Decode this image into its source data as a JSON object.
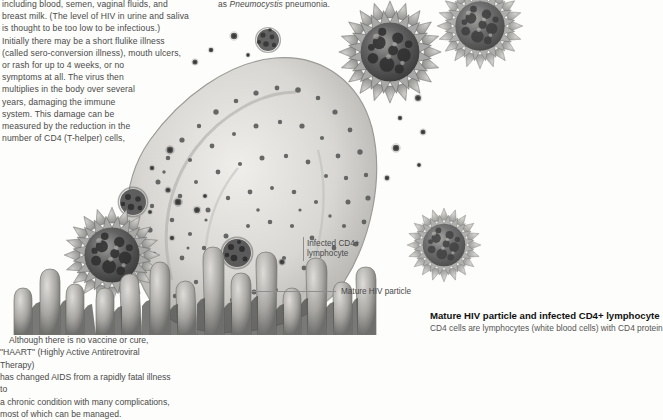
{
  "document": {
    "type": "textbook-page",
    "subject": "HIV and AIDS"
  },
  "left_column": {
    "text": "including blood, semen, vaginal fluids, and\nbreast milk. (The level of HIV in urine and saliva\nis thought to be too low to be infectious.)\nInitially there may be a short flulike illness\n(called sero-conversion illness), mouth ulcers,\nor rash for up to 4 weeks, or no\nsymptoms at all. The virus then\nmultiplies in the body over several\nyears, damaging the immune\nsystem. This damage can be\nmeasured by the reduction in the\nnumber of CD4 (T-helper) cells,"
  },
  "middle_note": {
    "prefix": "as ",
    "italic": "Pneumocystis",
    "suffix": " pneumonia."
  },
  "right_column": {
    "heading": "Kaposi's sarcoma skin lesion",
    "paragraph_1": "These tumors start as small, painless, flat areas\nor lumps, colored brown, red, blue, and purple,\nwhich look like bruises and grow until they",
    "paragraph_2": "candida, and cytomegalovirus, and a\ncancer called Kaposi's sarcoma.",
    "paragraph_3": "Those with HIV can be regularly monitored\nand have opportunistic infections treated\npromptly. People with HIV remain infectious\nthroughout their life, but can avoid passing it on\nby practicing safe sex using condoms. Pregnant\nmothers, who can pass HIV to their babies before\nor during birth, and by breastfeeding, can be\noffered antiretroviral drugs and cesarean delivery.\nThe only way to positively diagnose HIV is with\nan antibody blood test. This can take up to 3\nmonths to become positive after HIV infection.",
    "paragraph_4": "Although there is no vaccine or cure,\n\"HAART\" (Highly Active Antiretroviral Therapy)\nhas changed AIDS from a rapidly fatal illness to\na chronic condition with many complications,\nmost of which can be managed."
  },
  "caption": {
    "title": "Mature HIV particle and infected CD4+ lymphocyte",
    "subtitle": "CD4 cells are lymphocytes (white blood cells) with CD4 protein"
  },
  "callouts": {
    "infected_cell": "Infected CD4+\nlymphocyte",
    "mature_particle": "Mature HIV particle"
  },
  "illustration": {
    "name": "electron-micrograph-hiv-lymphocyte",
    "description": "Grayscale scanning electron micrograph showing a large infected CD4+ lymphocyte with budding HIV virions, several large spiky mature HIV particles, and microvilli",
    "colors": {
      "background": "#fdfdfb",
      "cell_body": "#c9c8c4",
      "virus_dark": "#4d4d4d",
      "virus_mid": "#8c8c8c",
      "virus_light": "#c2c2c0",
      "leader_line": "#8e8e8e"
    }
  }
}
